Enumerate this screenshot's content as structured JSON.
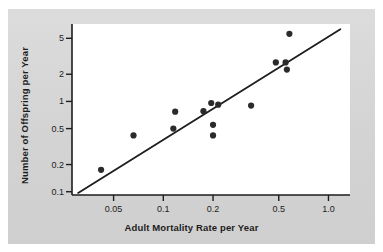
{
  "figure": {
    "background_color": "#ffffff",
    "panel_color": "#d5d5d5",
    "plot_area_color": "#ffffff",
    "axis_color": "#1d1d1d",
    "point_color": "#2b2b2b",
    "line_color": "#1d1d1d"
  },
  "chart_data": {
    "type": "scatter",
    "title": "",
    "subtitle": "",
    "xlabel": "Adult Mortality Rate per Year",
    "ylabel": "Number of Offspring per Year",
    "xscale": "log",
    "yscale": "log",
    "xlim": [
      0.028,
      1.35
    ],
    "ylim": [
      0.092,
      7.2
    ],
    "xticks": [
      0.05,
      0.1,
      0.2,
      0.5,
      1.0
    ],
    "xticklabels": [
      "0.05",
      "0.1",
      "0.2",
      "0.5",
      "1.0"
    ],
    "yticks": [
      0.1,
      0.2,
      0.5,
      1,
      2,
      5
    ],
    "yticklabels": [
      "0.1",
      "0.2",
      "0.5",
      "1",
      "2",
      "5"
    ],
    "grid": false,
    "legend": null,
    "points": [
      {
        "x": 0.042,
        "y": 0.175
      },
      {
        "x": 0.066,
        "y": 0.42
      },
      {
        "x": 0.115,
        "y": 0.5
      },
      {
        "x": 0.118,
        "y": 0.77
      },
      {
        "x": 0.175,
        "y": 0.78
      },
      {
        "x": 0.195,
        "y": 0.96
      },
      {
        "x": 0.2,
        "y": 0.42
      },
      {
        "x": 0.2,
        "y": 0.55
      },
      {
        "x": 0.215,
        "y": 0.92
      },
      {
        "x": 0.34,
        "y": 0.9
      },
      {
        "x": 0.48,
        "y": 2.7
      },
      {
        "x": 0.55,
        "y": 2.7
      },
      {
        "x": 0.56,
        "y": 2.25
      },
      {
        "x": 0.58,
        "y": 5.6
      }
    ],
    "trendline": {
      "label": "fitted line",
      "x_start": 0.0305,
      "y_start": 0.097,
      "x_end": 1.18,
      "y_end": 6.3
    },
    "annotations": []
  }
}
